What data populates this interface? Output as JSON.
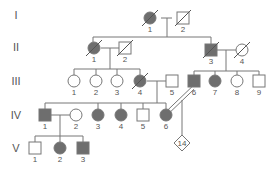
{
  "colors": {
    "affected": "#6e6e6e",
    "unaffected": "#ffffff",
    "line": "#777777",
    "text": "#555555"
  },
  "generations": [
    {
      "label": "I",
      "y": 15
    },
    {
      "label": "II",
      "y": 47
    },
    {
      "label": "III",
      "y": 81
    },
    {
      "label": "IV",
      "y": 115
    },
    {
      "label": "V",
      "y": 148
    }
  ],
  "individuals": [
    {
      "id": "I-1",
      "num": "1",
      "sex": "female",
      "affected": true,
      "deceased": true,
      "x": 150,
      "y": 18
    },
    {
      "id": "I-2",
      "num": "2",
      "sex": "male",
      "affected": false,
      "deceased": true,
      "x": 183,
      "y": 18
    },
    {
      "id": "II-1",
      "num": "1",
      "sex": "female",
      "affected": true,
      "deceased": true,
      "x": 94,
      "y": 48
    },
    {
      "id": "II-2",
      "num": "2",
      "sex": "male",
      "affected": false,
      "deceased": true,
      "x": 125,
      "y": 48
    },
    {
      "id": "II-3",
      "num": "3",
      "sex": "male",
      "affected": true,
      "deceased": true,
      "x": 211,
      "y": 50
    },
    {
      "id": "II-4",
      "num": "4",
      "sex": "female",
      "affected": false,
      "deceased": true,
      "x": 242,
      "y": 50
    },
    {
      "id": "III-1",
      "num": "1",
      "sex": "female",
      "affected": false,
      "deceased": false,
      "x": 74,
      "y": 81
    },
    {
      "id": "III-2",
      "num": "2",
      "sex": "female",
      "affected": false,
      "deceased": false,
      "x": 96,
      "y": 81
    },
    {
      "id": "III-3",
      "num": "3",
      "sex": "female",
      "affected": false,
      "deceased": false,
      "x": 117,
      "y": 81
    },
    {
      "id": "III-4",
      "num": "4",
      "sex": "female",
      "affected": true,
      "deceased": true,
      "x": 140,
      "y": 81
    },
    {
      "id": "III-5",
      "num": "5",
      "sex": "male",
      "affected": false,
      "deceased": false,
      "x": 172,
      "y": 81
    },
    {
      "id": "III-6",
      "num": "6",
      "sex": "male",
      "affected": true,
      "deceased": false,
      "x": 194,
      "y": 81
    },
    {
      "id": "III-7",
      "num": "7",
      "sex": "female",
      "affected": true,
      "deceased": false,
      "x": 215,
      "y": 81
    },
    {
      "id": "III-8",
      "num": "8",
      "sex": "female",
      "affected": false,
      "deceased": false,
      "x": 237,
      "y": 81
    },
    {
      "id": "III-9",
      "num": "9",
      "sex": "male",
      "affected": false,
      "deceased": false,
      "x": 259,
      "y": 81
    },
    {
      "id": "IV-1",
      "num": "1",
      "sex": "male",
      "affected": true,
      "deceased": false,
      "x": 45,
      "y": 115
    },
    {
      "id": "IV-2",
      "num": "2",
      "sex": "female",
      "affected": false,
      "deceased": false,
      "x": 76,
      "y": 115
    },
    {
      "id": "IV-3",
      "num": "3",
      "sex": "female",
      "affected": true,
      "deceased": false,
      "x": 98,
      "y": 115
    },
    {
      "id": "IV-4",
      "num": "4",
      "sex": "female",
      "affected": true,
      "deceased": false,
      "x": 121,
      "y": 115
    },
    {
      "id": "IV-5",
      "num": "5",
      "sex": "male",
      "affected": false,
      "deceased": false,
      "x": 143,
      "y": 115
    },
    {
      "id": "IV-6",
      "num": "6",
      "sex": "female",
      "affected": true,
      "deceased": false,
      "x": 166,
      "y": 115
    },
    {
      "id": "V-1",
      "num": "1",
      "sex": "male",
      "affected": false,
      "deceased": false,
      "x": 35,
      "y": 148
    },
    {
      "id": "V-2",
      "num": "2",
      "sex": "female",
      "affected": true,
      "deceased": false,
      "x": 60,
      "y": 148
    },
    {
      "id": "V-3",
      "num": "3",
      "sex": "male",
      "affected": true,
      "deceased": false,
      "x": 83,
      "y": 148
    },
    {
      "id": "V-offspring",
      "num": "14",
      "sex": "unknown",
      "affected": false,
      "deceased": false,
      "x": 182,
      "y": 143,
      "note": "14 offspring of unspecified sex"
    }
  ],
  "lines": [
    [
      161,
      18,
      172,
      18
    ],
    [
      167,
      18,
      167,
      37
    ],
    [
      93,
      37,
      211,
      37
    ],
    [
      93,
      37,
      93,
      42
    ],
    [
      211,
      37,
      211,
      44
    ],
    [
      101,
      48,
      119,
      48
    ],
    [
      110,
      48,
      110,
      69
    ],
    [
      74,
      69,
      140,
      69
    ],
    [
      74,
      69,
      74,
      75
    ],
    [
      96,
      69,
      96,
      75
    ],
    [
      117,
      69,
      117,
      75
    ],
    [
      140,
      69,
      140,
      75
    ],
    [
      217,
      50,
      236,
      50
    ],
    [
      226,
      50,
      226,
      71
    ],
    [
      194,
      71,
      259,
      71
    ],
    [
      194,
      71,
      194,
      75
    ],
    [
      215,
      71,
      215,
      75
    ],
    [
      237,
      71,
      237,
      75
    ],
    [
      259,
      71,
      259,
      75
    ],
    [
      147,
      81,
      166,
      81
    ],
    [
      157,
      81,
      157,
      103
    ],
    [
      45,
      103,
      166,
      103
    ],
    [
      45,
      103,
      45,
      109
    ],
    [
      98,
      103,
      98,
      109
    ],
    [
      121,
      103,
      121,
      109
    ],
    [
      143,
      103,
      143,
      109
    ],
    [
      166,
      103,
      166,
      109
    ],
    [
      51,
      115,
      70,
      115
    ],
    [
      60,
      115,
      60,
      136
    ],
    [
      35,
      136,
      83,
      136
    ],
    [
      35,
      136,
      35,
      142
    ],
    [
      60,
      136,
      60,
      142
    ],
    [
      83,
      136,
      83,
      142
    ],
    [
      182,
      100,
      182,
      136
    ]
  ],
  "consanguinity": {
    "from": [
      193,
      88
    ],
    "to": [
      168,
      112
    ]
  }
}
